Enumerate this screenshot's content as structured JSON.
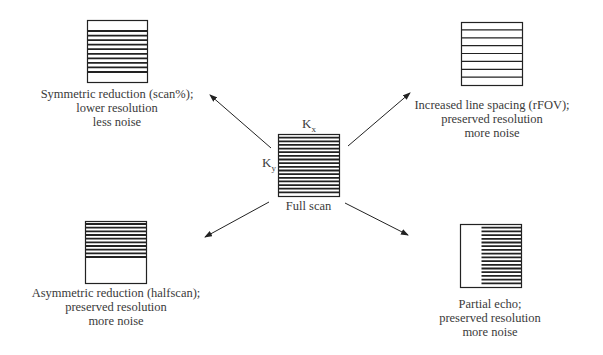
{
  "diagram": {
    "center": {
      "name": "Full scan",
      "label": "Full scan",
      "axis_x": "K",
      "axis_x_sub": "x",
      "axis_y": "K",
      "axis_y_sub": "y",
      "box": {
        "x": 278,
        "y": 134,
        "w": 61,
        "h": 62
      },
      "lines": 16,
      "pattern": "full"
    },
    "nodes": [
      {
        "id": "symmetric",
        "position": "top-left",
        "lines_text": [
          "Symmetric reduction (scan%);",
          "lower resolution",
          "less noise"
        ],
        "box": {
          "x": 87,
          "y": 20,
          "w": 60,
          "h": 62
        },
        "pattern": "symmetric",
        "lines": 10
      },
      {
        "id": "rfov",
        "position": "top-right",
        "lines_text": [
          "Increased line spacing (rFOV);",
          "preserved resolution",
          "more noise"
        ],
        "box": {
          "x": 461,
          "y": 22,
          "w": 61,
          "h": 63
        },
        "pattern": "spaced",
        "lines": 7
      },
      {
        "id": "halfscan",
        "position": "bottom-left",
        "lines_text": [
          "Asymmetric reduction (halfscan);",
          "preserved resolution",
          "more noise"
        ],
        "box": {
          "x": 85,
          "y": 221,
          "w": 61,
          "h": 62
        },
        "pattern": "top-half",
        "lines": 10
      },
      {
        "id": "partial-echo",
        "position": "bottom-right",
        "lines_text": [
          "Partial echo;",
          "preserved resolution",
          "more noise"
        ],
        "box": {
          "x": 460,
          "y": 224,
          "w": 61,
          "h": 63
        },
        "pattern": "right-part",
        "lines": 16
      }
    ],
    "arrows": [
      {
        "from": [
          271,
          148
        ],
        "to": [
          210,
          95
        ]
      },
      {
        "from": [
          348,
          146
        ],
        "to": [
          410,
          93
        ]
      },
      {
        "from": [
          269,
          202
        ],
        "to": [
          205,
          237
        ]
      },
      {
        "from": [
          345,
          203
        ],
        "to": [
          408,
          235
        ]
      }
    ],
    "colors": {
      "line": "#222222",
      "text": "#3a3a3a",
      "background": "#ffffff"
    }
  }
}
